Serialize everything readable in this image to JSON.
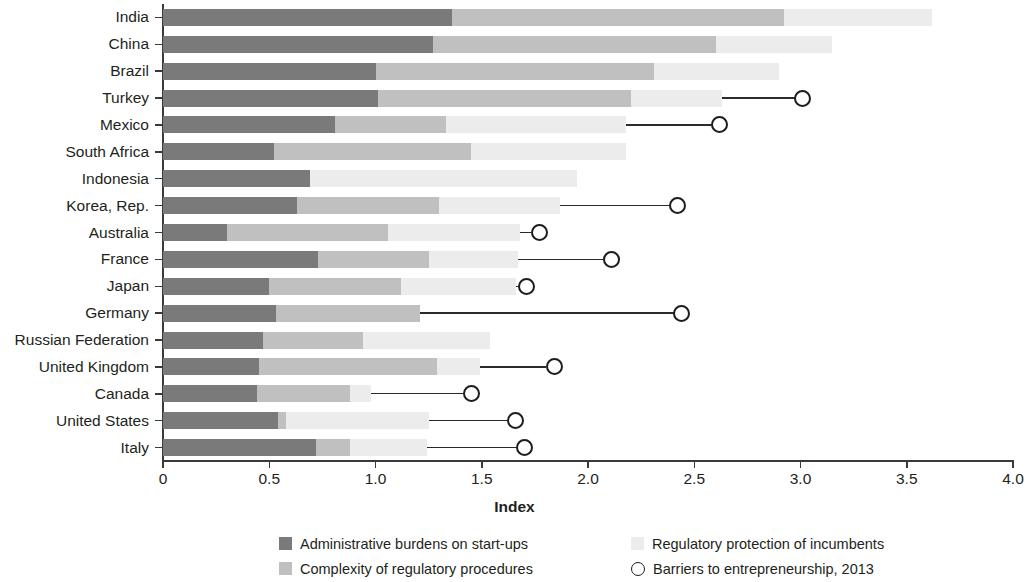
{
  "chart_data": {
    "type": "bar",
    "subtype": "stacked-horizontal-with-markers",
    "title": "",
    "xlabel": "Index",
    "ylabel": "",
    "xlim": [
      0,
      4.0
    ],
    "xticks": [
      "0",
      "0.5",
      "1.0",
      "1.5",
      "2.0",
      "2.5",
      "3.0",
      "3.5",
      "4.0"
    ],
    "xtick_values": [
      0,
      0.5,
      1.0,
      1.5,
      2.0,
      2.5,
      3.0,
      3.5,
      4.0
    ],
    "grid": false,
    "legend_position": "bottom",
    "categories": [
      "India",
      "China",
      "Brazil",
      "Turkey",
      "Mexico",
      "South Africa",
      "Indonesia",
      "Korea, Rep.",
      "Australia",
      "France",
      "Japan",
      "Germany",
      "Russian Federation",
      "United Kingdom",
      "Canada",
      "United States",
      "Italy"
    ],
    "series": [
      {
        "name": "Administrative burdens on start-ups",
        "color": "#7a7a7a",
        "values": [
          1.36,
          1.27,
          1.0,
          1.01,
          0.81,
          0.52,
          0.69,
          0.63,
          0.3,
          0.73,
          0.5,
          0.53,
          0.47,
          0.45,
          0.44,
          0.54,
          0.72
        ]
      },
      {
        "name": "Complexity of regulatory procedures",
        "color": "#c0c0c0",
        "values": [
          1.56,
          1.33,
          1.31,
          1.19,
          0.52,
          0.93,
          0.0,
          0.67,
          0.76,
          0.52,
          0.62,
          0.68,
          0.47,
          0.84,
          0.44,
          0.04,
          0.16
        ]
      },
      {
        "name": "Regulatory protection of incumbents",
        "color": "#ececec",
        "values": [
          0.7,
          0.55,
          0.59,
          0.43,
          0.85,
          0.73,
          1.26,
          0.57,
          0.62,
          0.42,
          0.54,
          0.0,
          0.6,
          0.2,
          0.1,
          0.67,
          0.36
        ]
      }
    ],
    "totals": [
      3.62,
      3.15,
      2.9,
      2.63,
      2.18,
      2.18,
      1.95,
      1.87,
      1.68,
      1.67,
      1.66,
      1.21,
      1.54,
      1.49,
      0.98,
      1.25,
      1.24
    ],
    "marker_series": {
      "name": "Barriers to entrepreneurship, 2013",
      "marker": "open-circle",
      "color": "#1d1d1d",
      "values": [
        null,
        null,
        null,
        3.01,
        2.62,
        null,
        null,
        2.42,
        1.77,
        2.11,
        1.71,
        2.44,
        null,
        1.84,
        1.45,
        1.66,
        1.7
      ]
    }
  },
  "legend": {
    "items": [
      {
        "key": "k1",
        "label": "Administrative burdens on start-ups"
      },
      {
        "key": "k3",
        "label": "Regulatory protection of incumbents"
      },
      {
        "key": "k2",
        "label": "Complexity of regulatory procedures"
      },
      {
        "key": "circle",
        "label": "Barriers to entrepreneurship, 2013"
      }
    ]
  }
}
